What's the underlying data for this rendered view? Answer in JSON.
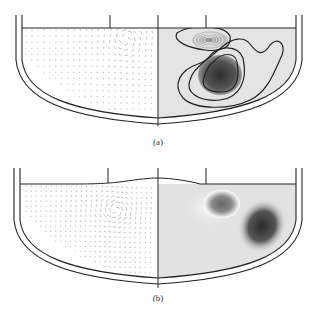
{
  "figure": {
    "panels": [
      {
        "id": "a",
        "caption": "(a)",
        "left_half": "velocity-vector-field",
        "right_half": "contour-plot-with-isolines"
      },
      {
        "id": "b",
        "caption": "(b)",
        "left_half": "velocity-vector-field",
        "right_half": "shaded-contour-plot"
      }
    ],
    "colors": {
      "wall": "#222222",
      "vector": "#9a9a9a",
      "background_fill": "#e4e4e4",
      "dark_region": "#3a3a3a",
      "isoline": "#1e1e1e"
    }
  }
}
